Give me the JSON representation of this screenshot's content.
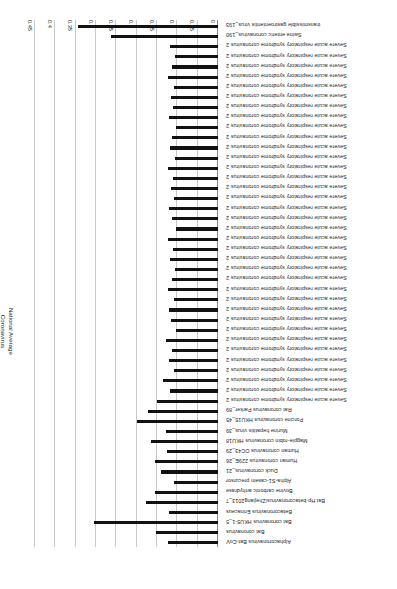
{
  "chart_data": {
    "type": "bar",
    "orientation": "horizontal",
    "title": "",
    "xlabel": "",
    "ylabel_line1": "National Average",
    "ylabel_line2": "Coronavirus",
    "xlim": [
      0,
      0.45
    ],
    "xticks": [
      "0",
      "0.05",
      "0.1",
      "0.15",
      "0.2",
      "0.25",
      "0.3",
      "0.35",
      "0.4",
      "0.45"
    ],
    "grid": true,
    "legend": "none",
    "categories": [
      "Alphacoronavirus Bat-CoV",
      "Bat coronavirus",
      "Bat coronavirus HKU5-1_5",
      "Betacoronavirus Erinaceus",
      "Bat Hp-betacoronavirus/Zhejiang2013_7",
      "Bovine carbonic anhydrase",
      "Alpha-S1-casein precursor",
      "Duck coronavirus_21",
      "Human coronavirus 229E_26",
      "Human coronavirus OC43_29",
      "Magpie-robin coronavirus HKU18",
      "Murine hepatitis virus_39",
      "Porcine coronavirus HKU15_45",
      "Rat coronavirus Parker_89",
      "Severe acute respiratory syndrome coronavirus 2",
      "Severe acute respiratory syndrome coronavirus 2",
      "Severe acute respiratory syndrome coronavirus 2",
      "Severe acute respiratory syndrome coronavirus 2",
      "Severe acute respiratory syndrome coronavirus 2",
      "Severe acute respiratory syndrome coronavirus 2",
      "Severe acute respiratory syndrome coronavirus 2",
      "Severe acute respiratory syndrome coronavirus 2",
      "Severe acute respiratory syndrome coronavirus 2",
      "Severe acute respiratory syndrome coronavirus 2",
      "Severe acute respiratory syndrome coronavirus 2",
      "Severe acute respiratory syndrome coronavirus 2",
      "Severe acute respiratory syndrome coronavirus 2",
      "Severe acute respiratory syndrome coronavirus 2",
      "Severe acute respiratory syndrome coronavirus 2",
      "Severe acute respiratory syndrome coronavirus 2",
      "Severe acute respiratory syndrome coronavirus 2",
      "Severe acute respiratory syndrome coronavirus 2",
      "Severe acute respiratory syndrome coronavirus 2",
      "Severe acute respiratory syndrome coronavirus 2",
      "Severe acute respiratory syndrome coronavirus 2",
      "Severe acute respiratory syndrome coronavirus 2",
      "Severe acute respiratory syndrome coronavirus 2",
      "Severe acute respiratory syndrome coronavirus 2",
      "Severe acute respiratory syndrome coronavirus 2",
      "Severe acute respiratory syndrome coronavirus 2",
      "Severe acute respiratory syndrome coronavirus 2",
      "Severe acute respiratory syndrome coronavirus 2",
      "Severe acute respiratory syndrome coronavirus 2",
      "Severe acute respiratory syndrome coronavirus 2",
      "Severe acute respiratory syndrome coronavirus 2",
      "Severe acute respiratory syndrome coronavirus 2",
      "Severe acute respiratory syndrome coronavirus 2",
      "Severe acute respiratory syndrome coronavirus 2",
      "Severe acute respiratory syndrome coronavirus 2",
      "Severe acute respiratory syndrome coronavirus 2",
      "Swine enteric coronavirus_190",
      "transmissible gastroenteritis virus_193"
    ],
    "values": [
      0.123,
      0.152,
      0.305,
      0.121,
      0.178,
      0.155,
      0.108,
      0.14,
      0.155,
      0.125,
      0.165,
      0.128,
      0.2,
      0.172,
      0.15,
      0.118,
      0.135,
      0.108,
      0.12,
      0.112,
      0.128,
      0.104,
      0.116,
      0.12,
      0.108,
      0.124,
      0.112,
      0.106,
      0.118,
      0.11,
      0.122,
      0.104,
      0.114,
      0.12,
      0.108,
      0.116,
      0.11,
      0.122,
      0.106,
      0.118,
      0.112,
      0.104,
      0.12,
      0.11,
      0.116,
      0.108,
      0.124,
      0.114,
      0.106,
      0.118,
      0.262,
      0.345
    ],
    "bar_color": "#111111",
    "grid_color": "#c9c9c9"
  }
}
